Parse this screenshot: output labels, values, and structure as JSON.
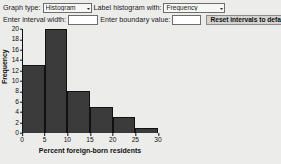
{
  "controls": {
    "graph_type_label": "Graph type:",
    "graph_type_value": "Histogram",
    "label_histogram_label": "Label histogram with:",
    "label_histogram_value": "Frequency",
    "interval_width_label": "Enter interval width:",
    "interval_width_value": "",
    "interval_width_placeholder": "",
    "boundary_value_label": "Enter boundary value:",
    "boundary_value_value": "",
    "boundary_value_placeholder": "",
    "reset_button_label": "Reset intervals to default",
    "caret_glyph": "▾"
  },
  "chart_data": {
    "type": "bar",
    "title": "",
    "xlabel": "Percent foreign-born residents",
    "ylabel": "Frequency",
    "categories": [
      "0-5",
      "5-10",
      "10-15",
      "15-20",
      "20-25",
      "25-30"
    ],
    "bin_edges": [
      0,
      5,
      10,
      15,
      20,
      25,
      30
    ],
    "values": [
      13,
      20,
      8,
      5,
      3,
      1
    ],
    "xlim": [
      0,
      30
    ],
    "ylim": [
      0,
      20
    ],
    "x_ticks": [
      0,
      5,
      10,
      15,
      20,
      25,
      30
    ],
    "y_ticks": [
      0,
      2,
      4,
      6,
      8,
      10,
      12,
      14,
      16,
      18,
      20
    ],
    "grid": false,
    "legend": false,
    "bar_color": "#3b3b3b",
    "axis_color": "#111111",
    "background_color": "#ececeb"
  }
}
